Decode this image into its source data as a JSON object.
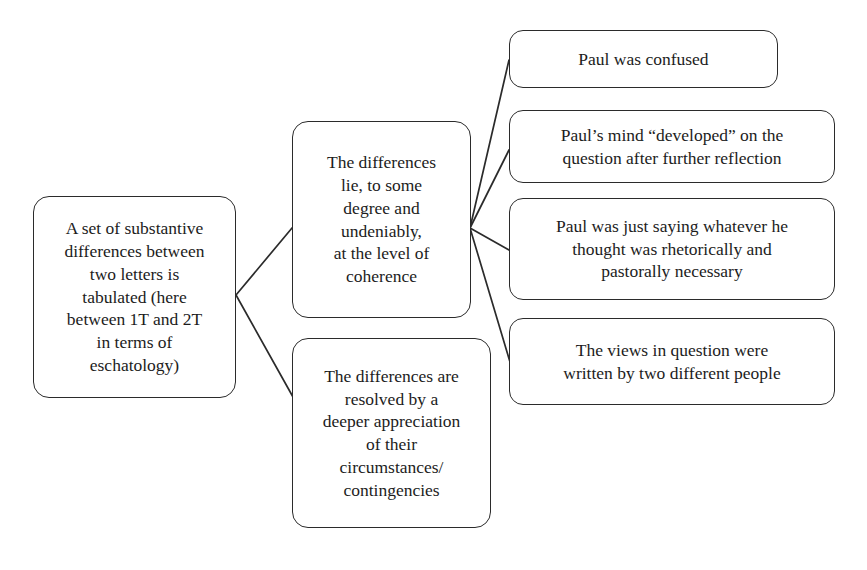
{
  "diagram": {
    "type": "flowchart",
    "orientation": "left-to-right",
    "background_color": "#ffffff",
    "line_color": "#2b2b2b",
    "text_color": "#1c1c1c",
    "nodes": {
      "root": {
        "id": "root",
        "text": "A set of substantive\ndifferences between\ntwo letters is\ntabulated (here\nbetween 1T and 2T\nin terms of\neschatology)"
      },
      "mid_coherence": {
        "id": "mid-coherence",
        "text": "The differences\nlie, to some\ndegree and\nundeniably,\nat the level of\ncoherence"
      },
      "mid_resolved": {
        "id": "mid-resolved",
        "text": "The differences are\nresolved by a\ndeeper appreciation\nof their\ncircumstances/\ncontingencies"
      },
      "leaf_confused": {
        "id": "leaf-confused",
        "text": "Paul was confused"
      },
      "leaf_developed": {
        "id": "leaf-developed",
        "text": "Paul’s mind “developed” on the\nquestion after further reflection"
      },
      "leaf_rhetorical": {
        "id": "leaf-rhetorical",
        "text": "Paul was just saying whatever he\nthought was rhetorically and\npastorally necessary"
      },
      "leaf_twopeople": {
        "id": "leaf-twopeople",
        "text": "The views in question were\nwritten by two different people"
      }
    },
    "edges": [
      {
        "from": "root",
        "to": "mid_coherence"
      },
      {
        "from": "root",
        "to": "mid_resolved"
      },
      {
        "from": "mid_coherence",
        "to": "leaf_confused"
      },
      {
        "from": "mid_coherence",
        "to": "leaf_developed"
      },
      {
        "from": "mid_coherence",
        "to": "leaf_rhetorical"
      },
      {
        "from": "mid_coherence",
        "to": "leaf_twopeople"
      }
    ]
  }
}
